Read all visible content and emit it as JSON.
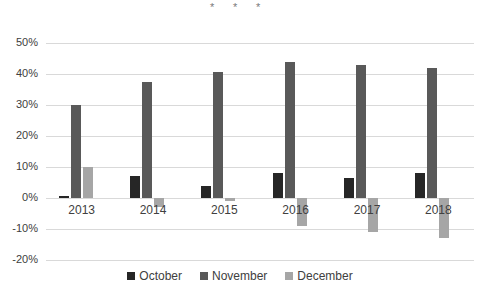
{
  "chart_data": {
    "type": "bar",
    "title": "",
    "subtitle": "",
    "xlabel": "",
    "ylabel": "",
    "categories": [
      "2013",
      "2014",
      "2015",
      "2016",
      "2017",
      "2018"
    ],
    "series": [
      {
        "name": "October",
        "color": "#262626",
        "values": [
          0.5,
          7,
          4,
          8,
          6.5,
          8
        ]
      },
      {
        "name": "November",
        "color": "#595959",
        "values": [
          30,
          37.5,
          40.5,
          44,
          43,
          42
        ]
      },
      {
        "name": "December",
        "color": "#a6a6a6",
        "values": [
          10,
          -3,
          -1,
          -9,
          -11,
          -13
        ]
      }
    ],
    "ylim": [
      -20,
      50
    ],
    "ytick_values": [
      50,
      40,
      30,
      20,
      10,
      0,
      -10,
      -20
    ],
    "ytick_labels": [
      "50%",
      "40%",
      "30%",
      "20%",
      "10%",
      "0%",
      "-10%",
      "-20%"
    ],
    "ytick_step": 10,
    "value_unit": "%",
    "grid": true,
    "grid_color": "#d9d9d9",
    "legend": {
      "position": "bottom",
      "entries": [
        "October",
        "November",
        "December"
      ]
    },
    "annotations": [
      {
        "text": "*",
        "x_px": 210,
        "y_px": 2
      },
      {
        "text": "*",
        "x_px": 233,
        "y_px": 2
      },
      {
        "text": "*",
        "x_px": 256,
        "y_px": 2
      }
    ],
    "background": "#ffffff"
  }
}
